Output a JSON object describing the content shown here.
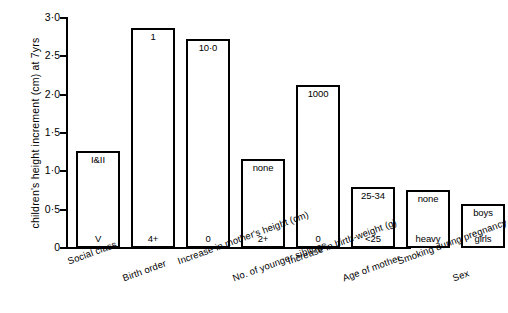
{
  "chart_data": {
    "type": "bar",
    "title": "",
    "xlabel": "",
    "ylabel": "children's height increment (cm) at 7yrs",
    "ylim": [
      0,
      3.0
    ],
    "ytick_labels": [
      "3·0",
      "2·5",
      "2·0",
      "1·5",
      "1·0",
      "0·5",
      "0"
    ],
    "ytick_values": [
      3.0,
      2.5,
      2.0,
      1.5,
      1.0,
      0.5,
      0
    ],
    "grid": false,
    "legend": false,
    "categories": [
      "Social class",
      "Birth order",
      "Increase in mother's height (cm)",
      "No. of younger siblings",
      "Increase in birth-weight (g)",
      "Age of mother",
      "Smoking during pregnancy",
      "Sex"
    ],
    "values": [
      1.27,
      2.87,
      2.73,
      1.16,
      2.13,
      0.8,
      0.76,
      0.57
    ],
    "bar_top_labels": [
      "I&II",
      "1",
      "10·0",
      "none",
      "1000",
      "25-34",
      "none",
      "boys"
    ],
    "bar_bottom_labels": [
      "V",
      "4+",
      "0",
      "2+",
      "0",
      "<25",
      "heavy",
      "girls"
    ],
    "bars": [
      {
        "category": "Social class",
        "value": 1.27,
        "top_label": "I&II",
        "bottom_label": "V"
      },
      {
        "category": "Birth order",
        "value": 2.87,
        "top_label": "1",
        "bottom_label": "4+"
      },
      {
        "category": "Increase in mother's height (cm)",
        "value": 2.73,
        "top_label": "10·0",
        "bottom_label": "0"
      },
      {
        "category": "No. of younger siblings",
        "value": 1.16,
        "top_label": "none",
        "bottom_label": "2+"
      },
      {
        "category": "Increase in birth-weight (g)",
        "value": 2.13,
        "top_label": "1000",
        "bottom_label": "0"
      },
      {
        "category": "Age of mother",
        "value": 0.8,
        "top_label": "25-34",
        "bottom_label": "<25"
      },
      {
        "category": "Smoking during pregnancy",
        "value": 0.76,
        "top_label": "none",
        "bottom_label": "heavy"
      },
      {
        "category": "Sex",
        "value": 0.57,
        "top_label": "boys",
        "bottom_label": "girls"
      }
    ],
    "colors": {
      "bar_fill": "#ffffff",
      "bar_edge": "#000000",
      "axis": "#000000",
      "text": "#000000"
    }
  }
}
